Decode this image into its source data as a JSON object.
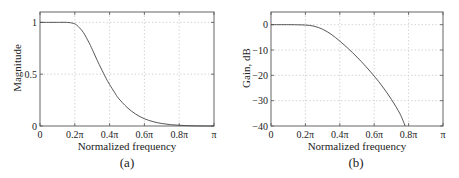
{
  "chart_data": [
    {
      "type": "line",
      "panel": "(a)",
      "title": "",
      "xlabel": "Normalized frequency",
      "ylabel": "Magnitude",
      "xlim": [
        0,
        1
      ],
      "ylim": [
        0,
        1.1
      ],
      "x_ticks": [
        0,
        0.2,
        0.4,
        0.6,
        0.8,
        1.0
      ],
      "x_tick_labels": [
        "0",
        "0.2π",
        "0.4π",
        "0.6π",
        "0.8π",
        "π"
      ],
      "y_ticks": [
        0,
        0.5,
        1
      ],
      "y_tick_labels": [
        "0",
        "0.5",
        "1"
      ],
      "grid": true,
      "legend": null,
      "series": [
        {
          "name": "magnitude response",
          "x": [
            0,
            0.05,
            0.1,
            0.15,
            0.18,
            0.2,
            0.22,
            0.25,
            0.28,
            0.3,
            0.33,
            0.35,
            0.38,
            0.4,
            0.43,
            0.45,
            0.5,
            0.55,
            0.6,
            0.65,
            0.7,
            0.75,
            0.8,
            0.85,
            0.9,
            0.95,
            1.0
          ],
          "values": [
            1,
            1,
            1,
            1,
            0.995,
            0.985,
            0.96,
            0.9,
            0.81,
            0.74,
            0.63,
            0.56,
            0.46,
            0.4,
            0.32,
            0.27,
            0.18,
            0.115,
            0.07,
            0.042,
            0.024,
            0.013,
            0.007,
            0.003,
            0.001,
            0.0003,
            0
          ]
        }
      ]
    },
    {
      "type": "line",
      "panel": "(b)",
      "title": "",
      "xlabel": "Normalized frequency",
      "ylabel": "Gain, dB",
      "xlim": [
        0,
        1
      ],
      "ylim": [
        -40,
        5
      ],
      "x_ticks": [
        0,
        0.2,
        0.4,
        0.6,
        0.8,
        1.0
      ],
      "x_tick_labels": [
        "0",
        "0.2π",
        "0.4π",
        "0.6π",
        "0.8π",
        "π"
      ],
      "y_ticks": [
        0,
        -10,
        -20,
        -30,
        -40
      ],
      "y_tick_labels": [
        "0",
        "−10",
        "−20",
        "−30",
        "−40"
      ],
      "grid": true,
      "legend": null,
      "series": [
        {
          "name": "gain response",
          "x": [
            0,
            0.1,
            0.15,
            0.2,
            0.25,
            0.3,
            0.35,
            0.4,
            0.45,
            0.5,
            0.55,
            0.6,
            0.65,
            0.7,
            0.75,
            0.78
          ],
          "values": [
            0,
            0,
            -0.05,
            -0.15,
            -0.6,
            -1.8,
            -3.8,
            -6.5,
            -9.5,
            -12.8,
            -16.4,
            -20.3,
            -24.6,
            -29.5,
            -35.2,
            -40
          ]
        }
      ]
    }
  ],
  "panels": {
    "a": {
      "caption": "(a)",
      "xlabel": "Normalized frequency",
      "ylabel": "Magnitude"
    },
    "b": {
      "caption": "(b)",
      "xlabel": "Normalized frequency",
      "ylabel": "Gain, dB"
    }
  },
  "colors": {
    "line": "#444444",
    "axis": "#555555",
    "grid": "#cccccc"
  }
}
